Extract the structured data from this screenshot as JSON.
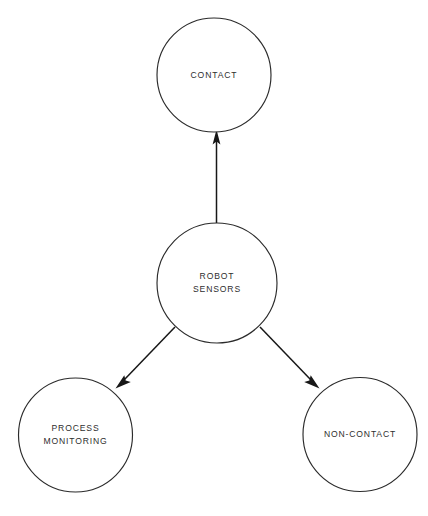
{
  "diagram": {
    "type": "node-link-tree",
    "background_color": "#ffffff",
    "stroke_color": "#2b2b2b",
    "text_color": "#2e2e2e",
    "nodes": [
      {
        "id": "contact",
        "label_lines": [
          "CONTACT"
        ],
        "line1": "CONTACT",
        "shape": "circle",
        "cx": 214,
        "cy": 75,
        "r": 57
      },
      {
        "id": "robot-sensors",
        "label_lines": [
          "ROBOT",
          "SENSORS"
        ],
        "line1": "ROBOT",
        "line2": "SENSORS",
        "shape": "circle",
        "cx": 217,
        "cy": 283,
        "r": 60
      },
      {
        "id": "process-monitoring",
        "label_lines": [
          "PROCESS",
          "MONITORING"
        ],
        "line1": "PROCESS",
        "line2": "MONITORING",
        "shape": "circle",
        "cx": 75.5,
        "cy": 435,
        "r": 57
      },
      {
        "id": "non-contact",
        "label_lines": [
          "NON-CONTACT"
        ],
        "line1": "NON-CONTACT",
        "shape": "circle",
        "cx": 360,
        "cy": 434.5,
        "r": 57
      }
    ],
    "edges": [
      {
        "id": "sensors-to-contact",
        "from": "robot-sensors",
        "to": "contact",
        "direction": "up",
        "arrowhead": "solid-triangle"
      },
      {
        "id": "sensors-to-process-monitoring",
        "from": "robot-sensors",
        "to": "process-monitoring",
        "direction": "down-left",
        "arrowhead": "solid-triangle"
      },
      {
        "id": "sensors-to-non-contact",
        "from": "robot-sensors",
        "to": "non-contact",
        "direction": "down-right",
        "arrowhead": "solid-triangle"
      }
    ]
  }
}
